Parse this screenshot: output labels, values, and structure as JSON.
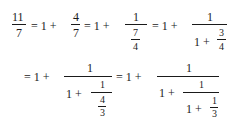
{
  "equation": {
    "line1": {
      "f1_num": "11",
      "f1_den": "7",
      "eq1": "= 1 +",
      "f2_num": "4",
      "f2_den": "7",
      "eq2": "= 1 +",
      "f3_num": "1",
      "f3_in_num": "7",
      "f3_in_den": "4",
      "eq3": "= 1 +",
      "f4_num": "1",
      "f4_den_lead": "1 +",
      "f4_in_num": "3",
      "f4_in_den": "4"
    },
    "line2": {
      "eq1": "= 1 +",
      "f5_num": "1",
      "f5_den_lead": "1 +",
      "f5_in_num": "1",
      "f5_in2_num": "4",
      "f5_in2_den": "3",
      "eq2": "= 1 +",
      "f6_num": "1",
      "f6_den_lead": "1 +",
      "f6_in_num": "1",
      "f6_in_den_lead": "1 +",
      "f6_in2_num": "1",
      "f6_in2_den": "3"
    }
  }
}
